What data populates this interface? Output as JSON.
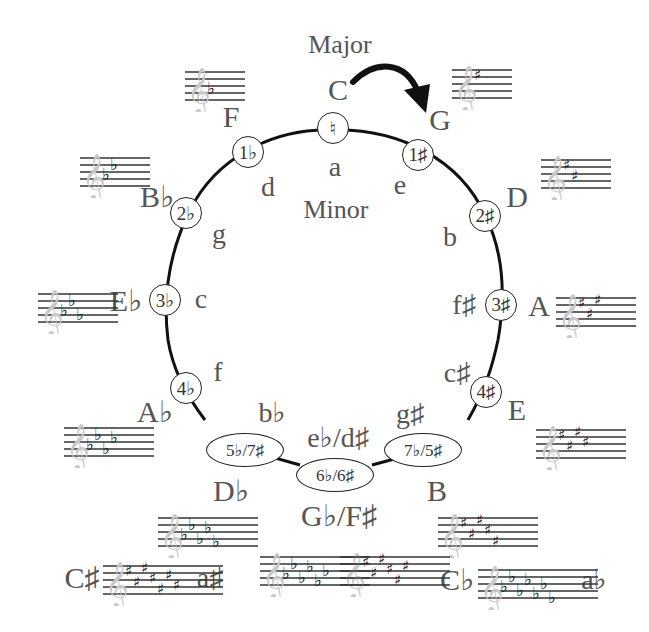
{
  "diagram": {
    "major_heading": "Major",
    "minor_heading": "Minor",
    "colors": {
      "ink": "#222222",
      "text": "#555555",
      "clef": "#c8c8c8",
      "background": "#ffffff"
    },
    "arrow": {
      "from": "C",
      "to": "G",
      "direction": "clockwise"
    },
    "nodes": [
      {
        "id": "n0",
        "signature": "♮",
        "major": "C",
        "minor": "a",
        "shape": "circle"
      },
      {
        "id": "n1",
        "signature": "1♯",
        "major": "G",
        "minor": "e",
        "shape": "circle"
      },
      {
        "id": "n2",
        "signature": "2♯",
        "major": "D",
        "minor": "b",
        "shape": "circle"
      },
      {
        "id": "n3",
        "signature": "3♯",
        "major": "A",
        "minor": "f♯",
        "shape": "circle"
      },
      {
        "id": "n4",
        "signature": "4♯",
        "major": "E",
        "minor": "c♯",
        "shape": "circle"
      },
      {
        "id": "n5",
        "signature": "7♭/5♯",
        "major": "B",
        "minor": "g♯",
        "shape": "oval"
      },
      {
        "id": "n6",
        "signature": "6♭/6♯",
        "major": "G♭/F♯",
        "minor": "e♭/d♯",
        "shape": "oval"
      },
      {
        "id": "n7",
        "signature": "5♭/7♯",
        "major": "D♭",
        "minor": "b♭",
        "shape": "oval"
      },
      {
        "id": "n8",
        "signature": "4♭",
        "major": "A♭",
        "minor": "f",
        "shape": "circle"
      },
      {
        "id": "n9",
        "signature": "3♭",
        "major": "E♭",
        "minor": "c",
        "shape": "circle"
      },
      {
        "id": "n10",
        "signature": "2♭",
        "major": "B♭",
        "minor": "g",
        "shape": "circle"
      },
      {
        "id": "n11",
        "signature": "1♭",
        "major": "F",
        "minor": "d",
        "shape": "circle"
      }
    ],
    "enharmonic_extremes": [
      {
        "major": "C♯",
        "minor": "a♯",
        "signature": "7♯"
      },
      {
        "major": "C♭",
        "minor": "a♭",
        "signature": "7♭"
      }
    ],
    "staves": [
      {
        "key": "C",
        "type": "none",
        "count": 0
      },
      {
        "key": "G",
        "type": "sharp",
        "count": 1
      },
      {
        "key": "D",
        "type": "sharp",
        "count": 2
      },
      {
        "key": "A",
        "type": "sharp",
        "count": 3
      },
      {
        "key": "E",
        "type": "sharp",
        "count": 4
      },
      {
        "key": "B",
        "type": "sharp",
        "count": 5
      },
      {
        "key": "F♯",
        "type": "sharp",
        "count": 6
      },
      {
        "key": "C♯",
        "type": "sharp",
        "count": 7
      },
      {
        "key": "F",
        "type": "flat",
        "count": 1
      },
      {
        "key": "B♭",
        "type": "flat",
        "count": 2
      },
      {
        "key": "E♭",
        "type": "flat",
        "count": 3
      },
      {
        "key": "A♭",
        "type": "flat",
        "count": 4
      },
      {
        "key": "D♭",
        "type": "flat",
        "count": 5
      },
      {
        "key": "G♭",
        "type": "flat",
        "count": 6
      },
      {
        "key": "C♭",
        "type": "flat",
        "count": 7
      }
    ]
  }
}
